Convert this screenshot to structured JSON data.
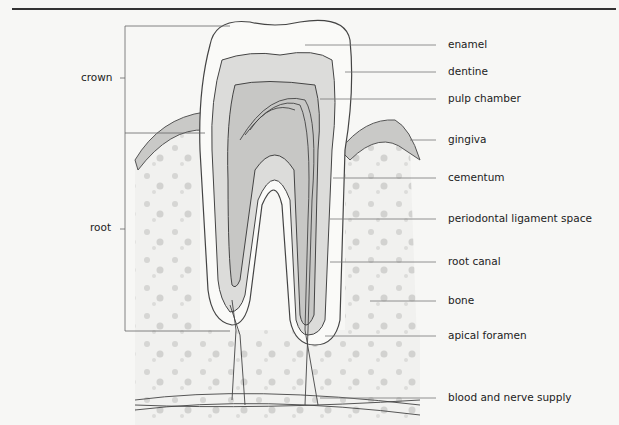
{
  "figure": {
    "title_clipped": "ANATOMY OF A TOOTH",
    "left_labels": [
      {
        "id": "crown",
        "text": "crown"
      },
      {
        "id": "root",
        "text": "root"
      }
    ],
    "right_labels": [
      {
        "id": "enamel",
        "text": "enamel"
      },
      {
        "id": "dentine",
        "text": "dentine"
      },
      {
        "id": "pulp-chamber",
        "text": "pulp chamber"
      },
      {
        "id": "gingiva",
        "text": "gingiva"
      },
      {
        "id": "cementum",
        "text": "cementum"
      },
      {
        "id": "periodontal-ligament-space",
        "text": "periodontal ligament space"
      },
      {
        "id": "root-canal",
        "text": "root canal"
      },
      {
        "id": "bone",
        "text": "bone"
      },
      {
        "id": "apical-foramen",
        "text": "apical foramen"
      },
      {
        "id": "blood-and-nerve-supply",
        "text": "blood and nerve supply"
      }
    ]
  }
}
